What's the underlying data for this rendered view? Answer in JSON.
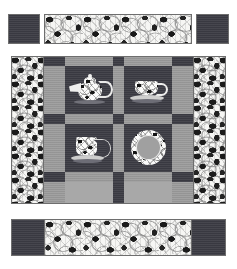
{
  "illustration": {
    "title": "Tea Time Quilt Layout Diagram",
    "style": "black-and-white quilt pattern line drawing",
    "canvas": {
      "width": 237,
      "height": 269,
      "background": "#ffffff"
    }
  },
  "palette": {
    "dark_solid": "#3c3c44",
    "medium_gray": "#9b9b9b",
    "light_gray": "#a8a8a8",
    "print_base": "#f6f6f4",
    "print_ink": "#1b1b1b",
    "outline": "#6e6e6e",
    "page_background": "#ffffff"
  },
  "components": {
    "top_band": {
      "label": "Top Border Strip Assembly",
      "left_square": {
        "name": "top-left-corner-square",
        "fabric": "dark_solid",
        "x": 8,
        "y": 14,
        "w": 32,
        "h": 30
      },
      "center_strip": {
        "name": "top-center-print-strip",
        "fabric": "print",
        "x": 44,
        "y": 14,
        "w": 148,
        "h": 30
      },
      "right_square": {
        "name": "top-right-corner-square",
        "fabric": "dark_solid",
        "x": 196,
        "y": 14,
        "w": 33,
        "h": 30
      }
    },
    "quilt_top": {
      "label": "Quilt Center Panel",
      "x": 11,
      "y": 56,
      "w": 215,
      "h": 148,
      "left_border": {
        "name": "left-print-border",
        "fabric": "print",
        "x": 11,
        "y": 56,
        "w": 33,
        "h": 148
      },
      "right_border": {
        "name": "right-print-border",
        "fabric": "print",
        "x": 193,
        "y": 56,
        "w": 33,
        "h": 148
      },
      "sashing": {
        "fabric_bars": "medium_gray",
        "fabric_cornerstones": "dark_solid",
        "columns_x": [
          44,
          54,
          112,
          122,
          180,
          190
        ],
        "rows_y": [
          56,
          66,
          114,
          124,
          172,
          182
        ]
      }
    },
    "blocks": [
      {
        "name": "block-teapot",
        "position": "top-left",
        "motif": "teapot",
        "motif_icon": "teapot-icon",
        "background": "dark_solid",
        "frame": "medium_gray",
        "x": 54,
        "y": 66,
        "w": 58,
        "h": 48
      },
      {
        "name": "block-teacup-saucer",
        "position": "top-right",
        "motif": "teacup on saucer",
        "motif_icon": "teacup-icon",
        "background": "dark_solid",
        "frame": "medium_gray",
        "x": 122,
        "y": 66,
        "w": 58,
        "h": 48
      },
      {
        "name": "block-mug-saucer",
        "position": "bottom-left",
        "motif": "mug with handle on saucer",
        "motif_icon": "mug-icon",
        "background": "dark_solid",
        "frame": "medium_gray",
        "x": 54,
        "y": 124,
        "w": 58,
        "h": 48
      },
      {
        "name": "block-plate",
        "position": "bottom-right",
        "motif": "decorative plate",
        "motif_icon": "plate-icon",
        "background": "dark_solid",
        "frame": "medium_gray",
        "x": 122,
        "y": 124,
        "w": 58,
        "h": 48
      }
    ],
    "bottom_band": {
      "label": "Bottom Border Strip Assembly",
      "bar": {
        "name": "bottom-dark-bar",
        "fabric": "dark_solid",
        "x": 11,
        "y": 219,
        "w": 215,
        "h": 37
      },
      "center_strip": {
        "name": "bottom-center-print-strip",
        "fabric": "print",
        "x": 44,
        "y": 219,
        "w": 148,
        "h": 37
      }
    }
  },
  "counts": {
    "blocks": 4,
    "cornerstones": 9,
    "sashing_bars": 12,
    "border_strips": 4
  }
}
